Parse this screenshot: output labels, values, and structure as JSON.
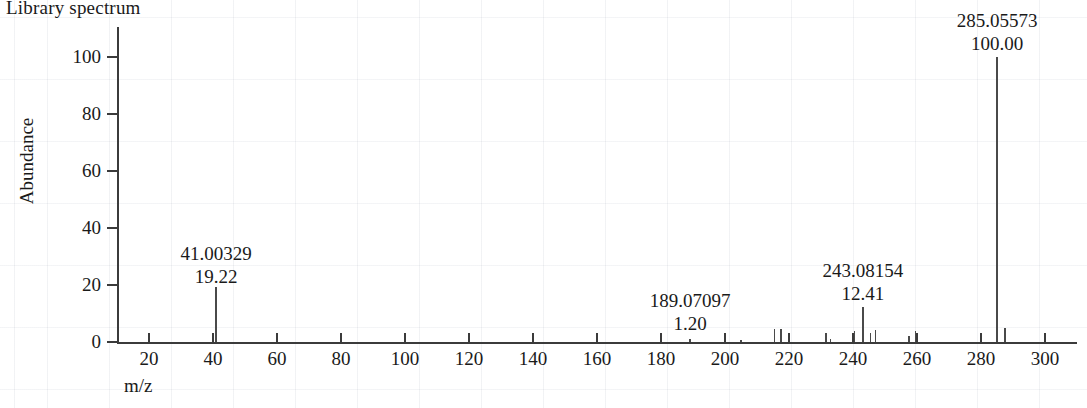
{
  "title": "Library spectrum",
  "axes": {
    "ylabel": "Abundance",
    "xlabel": "m/z",
    "y_ticks": [
      "0",
      "20",
      "40",
      "60",
      "80",
      "100"
    ],
    "x_ticks": [
      "20",
      "40",
      "60",
      "80",
      "100",
      "120",
      "140",
      "160",
      "180",
      "200",
      "220",
      "240",
      "260",
      "280",
      "300"
    ]
  },
  "annotations": [
    {
      "mz": "41.00329",
      "abundance": "19.22"
    },
    {
      "mz": "189.07097",
      "abundance": "1.20"
    },
    {
      "mz": "243.08154",
      "abundance": "12.41"
    },
    {
      "mz": "285.05573",
      "abundance": "100.00"
    }
  ],
  "chart_data": {
    "type": "bar",
    "title": "Library spectrum",
    "xlabel": "m/z",
    "ylabel": "Abundance",
    "xlim": [
      10,
      310
    ],
    "ylim": [
      0,
      105
    ],
    "grid": false,
    "legend": null,
    "xticks": [
      20,
      40,
      60,
      80,
      100,
      120,
      140,
      160,
      180,
      200,
      220,
      240,
      260,
      280,
      300
    ],
    "yticks": [
      0,
      20,
      40,
      60,
      80,
      100
    ],
    "labeled_peaks": [
      {
        "mz": 41.00329,
        "abundance": 19.22
      },
      {
        "mz": 189.07097,
        "abundance": 1.2
      },
      {
        "mz": 243.08154,
        "abundance": 12.41
      },
      {
        "mz": 285.05573,
        "abundance": 100.0
      }
    ],
    "x": [
      41.00329,
      189.07097,
      205.0,
      215.5,
      217.5,
      231.5,
      233.0,
      240.5,
      243.08154,
      245.5,
      247.0,
      257.5,
      259.5,
      285.05573,
      287.5
    ],
    "values": [
      19.22,
      1.2,
      0.8,
      4.5,
      4.5,
      3.0,
      1.2,
      4.0,
      12.41,
      3.2,
      4.2,
      2.2,
      4.0,
      100.0,
      5.0
    ]
  }
}
